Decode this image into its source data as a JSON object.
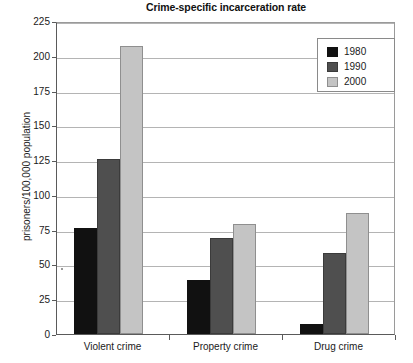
{
  "chart_data": {
    "type": "bar",
    "title": "Crime-specific incarceration rate",
    "xlabel": "",
    "ylabel": "prisoners/100,000 population",
    "categories": [
      "Violent crime",
      "Property crime",
      "Drug crime"
    ],
    "series": [
      {
        "name": "1980",
        "color": "#111111",
        "values": [
          76,
          39,
          7
        ]
      },
      {
        "name": "1990",
        "color": "#4f4f4f",
        "values": [
          126,
          69,
          58
        ]
      },
      {
        "name": "2000",
        "color": "#c4c4c4",
        "values": [
          207,
          79,
          87
        ]
      }
    ],
    "ylim": [
      0,
      225
    ],
    "ytick_step": 25,
    "yticks": [
      0,
      25,
      50,
      75,
      100,
      125,
      150,
      175,
      200,
      225
    ],
    "ytick_labels": [
      "0",
      "25",
      "50",
      "75",
      "100",
      "125",
      "150",
      "175",
      "200",
      "225"
    ],
    "grid": true,
    "grid_axis": "y",
    "legend_position": "top-right",
    "legend_entries": [
      "1980",
      "1990",
      "2000"
    ]
  }
}
